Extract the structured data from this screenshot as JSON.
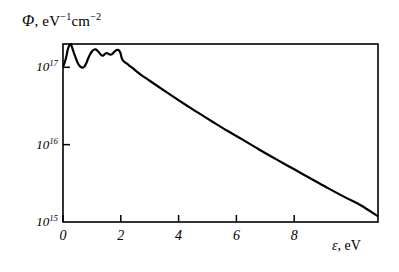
{
  "chart_data": {
    "type": "line",
    "title": "",
    "subtitle": "",
    "ylabel": "Φ, eV−1cm−2",
    "ylabel_parts": {
      "symbol": "Φ",
      "separator": ", ",
      "unit_base_1": "eV",
      "unit_exp_1": "−1",
      "unit_base_2": "cm",
      "unit_exp_2": "−2"
    },
    "xlabel": "ε, eV",
    "xlabel_parts": {
      "symbol": "ε",
      "separator": ", ",
      "unit": "eV"
    },
    "yscale": "log",
    "xscale": "linear",
    "xlim": [
      0,
      10.9
    ],
    "ylim": [
      1000000000000000.0,
      2e+17
    ],
    "grid": false,
    "legend": null,
    "legend_position": "none",
    "xticks": [
      0,
      2,
      4,
      6,
      8
    ],
    "xtick_labels": [
      "0",
      "2",
      "4",
      "6",
      "8"
    ],
    "yticks": [
      1000000000000000.0,
      1e+16,
      1e+17
    ],
    "ytick_labels": [
      "10¹⁵",
      "10¹⁶",
      "10¹⁷"
    ],
    "ytick_label_parts": [
      {
        "base": "10",
        "exp": "15"
      },
      {
        "base": "10",
        "exp": "16"
      },
      {
        "base": "10",
        "exp": "17"
      }
    ],
    "line_color": "#000000",
    "line_width": 2.2,
    "frame_color": "#000000",
    "background_color": "#ffffff",
    "series": [
      {
        "name": "flux spectrum",
        "x": [
          0.02,
          0.1,
          0.17,
          0.22,
          0.26,
          0.3,
          0.36,
          0.44,
          0.52,
          0.6,
          0.68,
          0.74,
          0.8,
          0.86,
          0.93,
          1.0,
          1.06,
          1.12,
          1.18,
          1.24,
          1.3,
          1.36,
          1.41,
          1.46,
          1.52,
          1.58,
          1.64,
          1.7,
          1.76,
          1.82,
          1.88,
          1.94,
          1.99,
          2.03,
          2.08,
          2.2,
          2.4,
          2.7,
          3.0,
          3.4,
          3.8,
          4.2,
          4.7,
          5.2,
          5.7,
          6.2,
          6.8,
          7.4,
          8.0,
          8.6,
          9.2,
          9.8,
          10.3,
          10.88
        ],
        "y": [
          1.05e+17,
          1.3e+17,
          1.72e+17,
          1.92e+17,
          2e+17,
          1.88e+17,
          1.6e+17,
          1.32e+17,
          1.12e+17,
          1.02e+17,
          9.9e+16,
          1.02e+17,
          1.12e+17,
          1.27e+17,
          1.45e+17,
          1.6e+17,
          1.68e+17,
          1.7e+17,
          1.66e+17,
          1.57e+17,
          1.47e+17,
          1.41e+17,
          1.44e+17,
          1.5e+17,
          1.52e+17,
          1.49e+17,
          1.46e+17,
          1.48e+17,
          1.56e+17,
          1.64e+17,
          1.68e+17,
          1.65e+17,
          1.52e+17,
          1.32e+17,
          1.22e+17,
          1.12e+17,
          9.8e+16,
          8e+16,
          6.7e+16,
          5.3e+16,
          4.2e+16,
          3.35e+16,
          2.55e+16,
          1.95e+16,
          1.5e+16,
          1.17e+16,
          8600000000000000.0,
          6400000000000000.0,
          4800000000000000.0,
          3600000000000000.0,
          2700000000000000.0,
          2050000000000000.0,
          1650000000000000.0,
          1200000000000000.0
        ],
        "annotations": [
          "sharp main peak near 0.25 eV",
          "deep minimum near 0.7 eV",
          "oscillatory fine structure 1.0–2.0 eV",
          "knee / break at 2 eV",
          "smooth exponential decay above 2 eV"
        ]
      }
    ]
  },
  "plot_geometry": {
    "left": 63,
    "right": 378,
    "top": 44,
    "bottom": 222
  }
}
